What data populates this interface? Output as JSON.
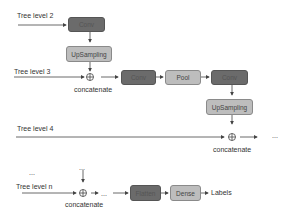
{
  "diagram": {
    "tree_levels": [
      "Tree level 2",
      "Tree level 3",
      "Tree level 4",
      "Tree level n"
    ],
    "nodes": {
      "conv1": "Conv",
      "upsampling1": "UpSampling",
      "conv2": "Conv",
      "pool": "Pool",
      "conv3": "Conv",
      "upsampling2": "UpSampling",
      "flatten": "Flatten",
      "dense": "Dense"
    },
    "concat_labels": [
      "concatenate",
      "concatenate",
      "concatenate"
    ],
    "ellipsis": "...",
    "output_label": "Labels",
    "colors": {
      "dark_box": "#6b6b6b",
      "light_box": "#bdbdbd",
      "line": "#444444"
    }
  }
}
